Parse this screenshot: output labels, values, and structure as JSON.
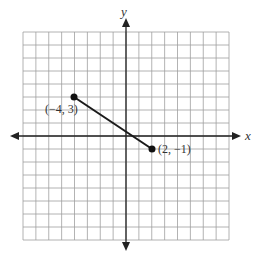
{
  "graph": {
    "x_axis_label": "x",
    "y_axis_label": "y",
    "grid": {
      "columns": 16,
      "rows": 16,
      "x_range": [
        -8,
        8
      ],
      "y_range": [
        -8,
        8
      ]
    },
    "colors": {
      "grid": "#9a9a9a",
      "axis": "#222222",
      "segment": "#1a1a1a"
    },
    "points": [
      {
        "x": -4,
        "y": 3,
        "label": "(−4, 3)"
      },
      {
        "x": 2,
        "y": -1,
        "label": "(2, −1)"
      }
    ]
  },
  "chart_data": {
    "type": "line",
    "title": "",
    "xlabel": "x",
    "ylabel": "y",
    "x": [
      -4,
      2
    ],
    "y": [
      3,
      -1
    ],
    "annotations": [
      "(−4, 3)",
      "(2, −1)"
    ],
    "grid": true,
    "xlim": [
      -8,
      8
    ],
    "ylim": [
      -8,
      8
    ]
  }
}
